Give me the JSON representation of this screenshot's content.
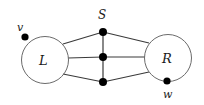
{
  "figure": {
    "type": "graph-diagram",
    "width": 204,
    "height": 105,
    "background_color": "#ffffff",
    "stroke_color": "#3a3a3a",
    "circle_stroke_color": "#6b6b6b",
    "vertex_fill_color": "#000000"
  },
  "labels": {
    "left_set": "L",
    "right_set": "R",
    "separator_set": "S",
    "vertex_v": "v",
    "vertex_w": "w"
  },
  "geometry": {
    "left_circle": {
      "cx": 45,
      "cy": 60,
      "r": 23.5
    },
    "right_circle": {
      "cx": 168,
      "cy": 58,
      "r": 23.5
    },
    "separator_vertices": [
      {
        "name": "s-top",
        "cx": 103,
        "cy": 32,
        "r": 4
      },
      {
        "name": "s-middle",
        "cx": 103,
        "cy": 57,
        "r": 4
      },
      {
        "name": "s-bottom",
        "cx": 103,
        "cy": 82,
        "r": 4
      }
    ],
    "vertex_v": {
      "cx": 25,
      "cy": 37,
      "r": 3.6
    },
    "vertex_w": {
      "cx": 167,
      "cy": 81,
      "r": 3.6
    },
    "label_positions": {
      "left_set": {
        "x": 39,
        "y": 54
      },
      "right_set": {
        "x": 162,
        "y": 52
      },
      "separator_set": {
        "x": 98,
        "y": 9
      },
      "vertex_v": {
        "x": 17,
        "y": 22
      },
      "vertex_w": {
        "x": 163,
        "y": 89
      }
    },
    "edges": [
      {
        "name": "edge-left-to-s-top",
        "x1": 63,
        "y1": 44,
        "x2": 103,
        "y2": 32
      },
      {
        "name": "edge-left-to-s-middle",
        "x1": 68,
        "y1": 58,
        "x2": 103,
        "y2": 57
      },
      {
        "name": "edge-left-to-s-bottom",
        "x1": 63,
        "y1": 74,
        "x2": 103,
        "y2": 82
      },
      {
        "name": "edge-s-top-to-right",
        "x1": 103,
        "y1": 32,
        "x2": 149,
        "y2": 43
      },
      {
        "name": "edge-s-middle-to-right",
        "x1": 103,
        "y1": 57,
        "x2": 145,
        "y2": 57
      },
      {
        "name": "edge-s-bottom-to-right",
        "x1": 103,
        "y1": 82,
        "x2": 149,
        "y2": 72
      },
      {
        "name": "edge-s-spine",
        "x1": 103,
        "y1": 32,
        "x2": 103,
        "y2": 82
      }
    ]
  }
}
